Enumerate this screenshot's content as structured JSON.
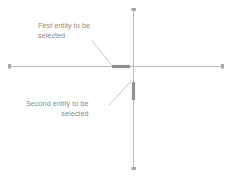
{
  "canvas": {
    "width": 232,
    "height": 177,
    "background": "#ffffff"
  },
  "colors": {
    "construction_line": "#b9b9b9",
    "highlight_entity": "#8f8f8f",
    "leader_line": "#c2c2c2",
    "text": "#8a8a8a",
    "endpoint_marker": "#a8a8a8"
  },
  "annotations": {
    "first": {
      "name": "first-entity-callout",
      "line1": "First entity to be",
      "line2": "selected",
      "trailing_dash": "—"
    },
    "second": {
      "name": "second-entity-callout",
      "line1": "Second entity to be",
      "line2": "selected",
      "trailing_dash": "—"
    }
  },
  "geometry": {
    "horizontal_axis": {
      "x1": 9,
      "y1": 66,
      "x2": 223,
      "y2": 66
    },
    "vertical_axis": {
      "x1": 133,
      "y1": 9,
      "x2": 133,
      "y2": 170
    },
    "highlight_horizontal": {
      "x1": 112,
      "y1": 66,
      "x2": 130,
      "y2": 66
    },
    "highlight_vertical": {
      "x1": 133,
      "y1": 82,
      "x2": 133,
      "y2": 100
    },
    "leader_first": {
      "x1": 93,
      "y1": 41,
      "x2": 112,
      "y2": 65
    },
    "leader_second": {
      "x1": 110,
      "y1": 105,
      "x2": 131,
      "y2": 82
    }
  }
}
